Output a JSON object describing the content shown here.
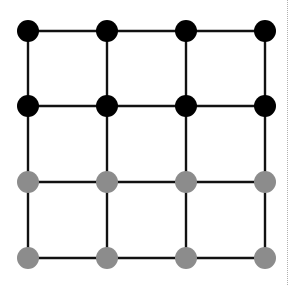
{
  "diagram": {
    "type": "grid-graph",
    "rows": 4,
    "cols": 4,
    "x_positions": [
      28,
      107,
      186,
      265
    ],
    "y_positions": [
      31,
      106,
      182,
      258
    ],
    "node_radius": 11,
    "edge_color": "#111111",
    "edge_width": 2.4,
    "row_colors": [
      "#000000",
      "#000000",
      "#8c8c8c",
      "#8c8c8c"
    ],
    "legend": {
      "black_nodes": "rows 1-2",
      "gray_nodes": "rows 3-4"
    }
  },
  "divider": {
    "style": "dotted",
    "color": "#b0b0b0"
  }
}
